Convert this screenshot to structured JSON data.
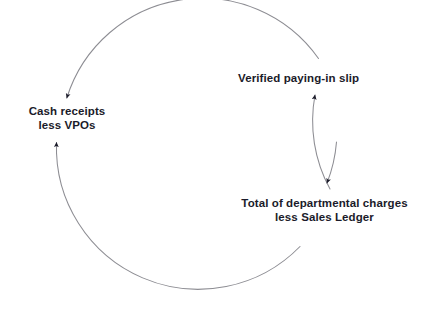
{
  "diagram": {
    "type": "cycle-diagram",
    "background_color": "#ffffff",
    "arc_color": "#8d8d93",
    "arrow_color": "#1b1b2a",
    "text_color": "#1b1b2a",
    "geometry": {
      "center_x": 195,
      "center_y": 160,
      "radius": 142
    },
    "nodes": [
      {
        "id": "verified-slip",
        "lines": [
          "Verified paying-in slip"
        ],
        "position": "top-right"
      },
      {
        "id": "cash-receipts",
        "lines": [
          "Cash receipts",
          "less VPOs"
        ],
        "position": "left"
      },
      {
        "id": "total-charges",
        "lines": [
          "Total of departmental charges",
          "less Sales Ledger"
        ],
        "position": "bottom-right"
      }
    ],
    "connectors": [
      {
        "id": "slip-to-cash",
        "from": "verified-slip",
        "to": "cash-receipts",
        "direction": "counter-clockwise-over-top",
        "arrowhead": "at-cash-receipts"
      },
      {
        "id": "cash-to-total",
        "from": "cash-receipts",
        "to": "total-charges",
        "direction": "counter-clockwise-under-bottom",
        "arrowhead": "at-total-charges"
      },
      {
        "id": "total-to-slip",
        "from": "total-charges",
        "to": "verified-slip",
        "direction": "counter-clockwise-up-right",
        "arrowhead": "at-verified-slip"
      }
    ]
  }
}
